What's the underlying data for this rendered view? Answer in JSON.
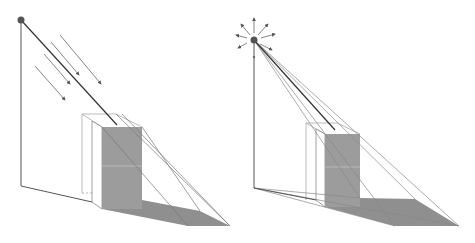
{
  "figure": {
    "panels": [
      {
        "id": "parallel-light",
        "light_type": "directional",
        "light_icon": "light-source-dot",
        "ray_icon": "parallel-arrow"
      },
      {
        "id": "point-light",
        "light_type": "point",
        "light_icon": "radiating-light-source",
        "ray_icon": "radial-arrow"
      }
    ],
    "colors": {
      "shadow_fill": "#8c8c8c",
      "face_fill": "#9a9a9a",
      "line_dark": "#444444",
      "line_light": "#9a9a9a",
      "light_dot": "#555555"
    }
  }
}
